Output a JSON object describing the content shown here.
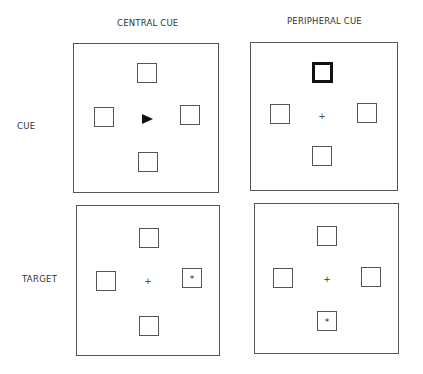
{
  "columns": [
    {
      "label": "CENTRAL CUE"
    },
    {
      "label": "PERIPHERAL CUE"
    }
  ],
  "rows": [
    {
      "label": "CUE"
    },
    {
      "label": "TARGET"
    }
  ],
  "panels": {
    "central_cue": {
      "fixation": "arrow-right",
      "boxes": [
        "top",
        "left",
        "right",
        "bottom"
      ],
      "highlighted_box": null,
      "target_box": null
    },
    "peripheral_cue": {
      "fixation": "+",
      "boxes": [
        "top",
        "left",
        "right",
        "bottom"
      ],
      "highlighted_box": "top",
      "target_box": null
    },
    "central_target": {
      "fixation": "+",
      "boxes": [
        "top",
        "left",
        "right",
        "bottom"
      ],
      "highlighted_box": null,
      "target_box": "right",
      "target_symbol": "*"
    },
    "peripheral_target": {
      "fixation": "+",
      "boxes": [
        "top",
        "left",
        "right",
        "bottom"
      ],
      "highlighted_box": null,
      "target_box": "bottom",
      "target_symbol": "*"
    }
  }
}
